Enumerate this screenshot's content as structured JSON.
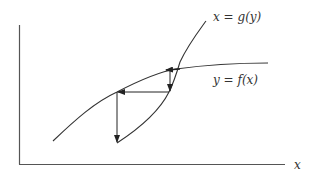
{
  "diagram": {
    "type": "cobweb-iteration",
    "axes": {
      "x_label": "x",
      "y_label": ""
    },
    "curves": [
      {
        "name": "g",
        "label": "x = g(y)"
      },
      {
        "name": "f",
        "label": "y = f(x)"
      }
    ],
    "colors": {
      "stroke": "#333333",
      "axis": "#555555",
      "background": "#ffffff"
    }
  }
}
